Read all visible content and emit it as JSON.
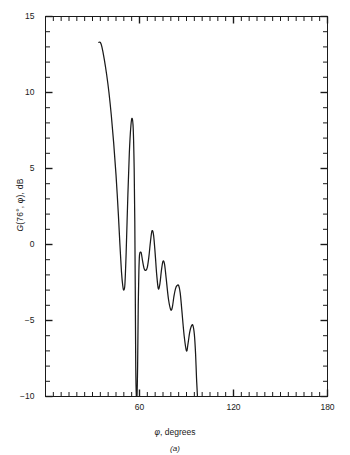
{
  "figure": {
    "caption": "(a)",
    "xlabel_symbol": "φ",
    "xlabel_rest": ", degrees",
    "ylabel_g": "G",
    "ylabel_args": "(76°, φ)",
    "ylabel_unit": ", dB",
    "line_color": "#1a1a1a",
    "axis_color": "#1a1a1a",
    "background": "#ffffff"
  },
  "axes": {
    "x": {
      "label": "φ, degrees",
      "min": 0,
      "max": 180,
      "major_ticks": [
        60,
        120,
        180
      ],
      "major_tick_labels": [
        "60",
        "120",
        "180"
      ],
      "minor_tick_step": 5,
      "plot_x_start_deg": 34
    },
    "y": {
      "label": "G(76°, φ), dB",
      "min": -10,
      "max": 15,
      "major_ticks": [
        15,
        10,
        5,
        0,
        -5,
        -10
      ],
      "major_tick_labels": [
        "15",
        "10",
        "5",
        "0",
        "−5",
        "−10"
      ],
      "minor_tick_step": 1
    }
  },
  "chart_data": {
    "type": "line",
    "title": "",
    "xlabel": "φ, degrees",
    "ylabel": "G(76°, φ), dB",
    "xlim": [
      0,
      180
    ],
    "ylim": [
      -10,
      15
    ],
    "xticks": [
      60,
      120,
      180
    ],
    "yticks": [
      15,
      10,
      5,
      0,
      -5,
      -10
    ],
    "grid": false,
    "legend": null,
    "annotations": [
      "(a)"
    ],
    "series": [
      {
        "name": "G(76°, φ)",
        "color": "#1a1a1a",
        "x": [
          34.0,
          35.0,
          36.0,
          37.5,
          39.0,
          40.5,
          42.0,
          43.5,
          45.0,
          46.5,
          47.5,
          48.5,
          49.3,
          50.0,
          50.7,
          51.5,
          52.5,
          53.5,
          54.5,
          55.3,
          56.0,
          56.6,
          57.0,
          57.3,
          57.6,
          58.0,
          58.4,
          58.8,
          59.2,
          59.6,
          60.0,
          60.6,
          61.2,
          62.0,
          63.0,
          64.0,
          65.0,
          66.0,
          67.0,
          68.0,
          69.0,
          70.0,
          71.0,
          72.0,
          73.0,
          74.0,
          75.0,
          76.0,
          77.0,
          78.5,
          80.0,
          81.0,
          82.0,
          83.0,
          84.0,
          85.0,
          86.0,
          87.0,
          88.5,
          90.0,
          91.0,
          92.0,
          93.0,
          94.0,
          95.0,
          95.8,
          96.4,
          97.0
        ],
        "y": [
          13.3,
          13.3,
          13.0,
          12.2,
          11.2,
          10.0,
          8.5,
          6.7,
          4.6,
          2.0,
          0.0,
          -1.8,
          -2.7,
          -3.0,
          -2.6,
          -0.5,
          3.0,
          6.0,
          7.8,
          8.3,
          7.6,
          5.0,
          1.5,
          -3.0,
          -8.0,
          -10.0,
          -10.0,
          -8.0,
          -4.0,
          -1.8,
          -0.7,
          -0.5,
          -0.6,
          -1.1,
          -1.6,
          -1.7,
          -1.5,
          -0.8,
          0.2,
          0.9,
          0.6,
          -0.6,
          -2.0,
          -2.9,
          -2.6,
          -1.7,
          -1.1,
          -1.3,
          -2.2,
          -3.6,
          -4.3,
          -4.1,
          -3.4,
          -2.9,
          -2.7,
          -2.7,
          -3.2,
          -4.3,
          -6.0,
          -7.0,
          -6.5,
          -5.8,
          -5.4,
          -5.3,
          -5.9,
          -7.2,
          -8.8,
          -10.0
        ]
      }
    ],
    "features": {
      "main_lobe_edge_value_db": 13.3,
      "first_null_db": -3.0,
      "second_lobe_peak_db": 8.3,
      "second_lobe_peak_deg": 55.3,
      "sidelobe_peaks_db": [
        -0.5,
        0.9,
        -1.1,
        -2.7,
        -5.3
      ],
      "sidelobe_peaks_deg": [
        60.6,
        68.0,
        75.0,
        84.5,
        94.0
      ],
      "sidelobe_nulls_db": [
        -1.7,
        -2.9,
        -4.3,
        -7.0
      ],
      "sidelobe_nulls_deg": [
        64.0,
        72.0,
        80.5,
        90.0
      ],
      "cutoff_deg": 97.0
    }
  }
}
